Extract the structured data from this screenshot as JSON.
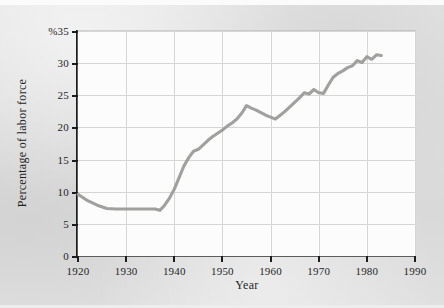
{
  "figure": {
    "background_color": "#dedede",
    "plot_background_color": "#fcfcfc",
    "axis_color": "#1c1c1c",
    "grid_color": "#d6d6d6"
  },
  "chart_data": {
    "type": "line",
    "title": "",
    "subtitle": "",
    "xlabel": "Year",
    "ylabel": "Percentage of labor force",
    "y_unit_label": "%35",
    "xlim": [
      1920,
      1990
    ],
    "ylim": [
      0,
      35
    ],
    "grid": true,
    "legend": "none",
    "line_color": "#9b9b99",
    "x_ticks": [
      1920,
      1930,
      1940,
      1950,
      1960,
      1970,
      1980,
      1990
    ],
    "x_tick_labels": [
      "1920",
      "1930",
      "1940",
      "1950",
      "1960",
      "1970",
      "1980",
      "1990"
    ],
    "y_ticks": [
      0,
      5,
      10,
      15,
      20,
      25,
      30,
      35
    ],
    "y_tick_labels": [
      "0",
      "5",
      "10",
      "15",
      "20",
      "25",
      "30",
      "%35"
    ],
    "series": [
      {
        "name": "Percentage of labor force",
        "x": [
          1920,
          1922,
          1924,
          1926,
          1928,
          1930,
          1932,
          1934,
          1936,
          1937,
          1938,
          1939,
          1940,
          1941,
          1942,
          1943,
          1944,
          1945,
          1946,
          1947,
          1948,
          1949,
          1950,
          1951,
          1952,
          1953,
          1954,
          1955,
          1956,
          1957,
          1958,
          1959,
          1960,
          1961,
          1962,
          1963,
          1964,
          1965,
          1966,
          1967,
          1968,
          1969,
          1970,
          1971,
          1972,
          1973,
          1974,
          1975,
          1976,
          1977,
          1978,
          1979,
          1980,
          1981,
          1982,
          1983
        ],
        "y": [
          9.6,
          8.6,
          7.9,
          7.4,
          7.3,
          7.3,
          7.3,
          7.3,
          7.3,
          7.1,
          7.9,
          9.0,
          10.4,
          12.2,
          14.0,
          15.3,
          16.3,
          16.6,
          17.3,
          18.0,
          18.6,
          19.1,
          19.6,
          20.2,
          20.7,
          21.3,
          22.2,
          23.4,
          23.0,
          22.7,
          22.3,
          21.9,
          21.6,
          21.3,
          21.9,
          22.5,
          23.2,
          23.9,
          24.6,
          25.4,
          25.2,
          25.9,
          25.4,
          25.3,
          26.6,
          27.8,
          28.4,
          28.8,
          29.3,
          29.6,
          30.4,
          30.1,
          31.0,
          30.6,
          31.3,
          31.2
        ]
      }
    ]
  }
}
